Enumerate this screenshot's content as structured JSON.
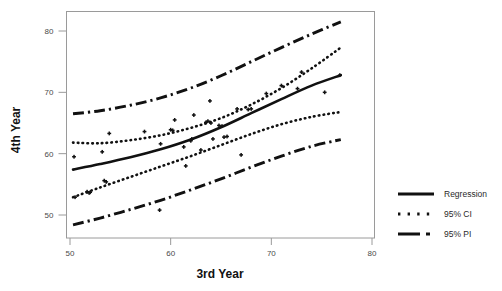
{
  "chart_data": {
    "type": "scatter",
    "title": "",
    "xlabel": "3rd Year",
    "ylabel": "4th Year",
    "xlim": [
      48.5,
      81.5
    ],
    "ylim": [
      46.5,
      83.0
    ],
    "xticks": [
      50,
      60,
      70,
      80
    ],
    "yticks": [
      50,
      60,
      70,
      80
    ],
    "xtick_labels": [
      "50",
      "60",
      "70",
      "80"
    ],
    "ytick_labels": [
      "50",
      "60",
      "70",
      "80"
    ],
    "grid": false,
    "legend_position": "right",
    "legend": [
      {
        "label": "Regression",
        "style": "solid"
      },
      {
        "label": "95% CI",
        "style": "dotted"
      },
      {
        "label": "95% PI",
        "style": "dash-dot"
      }
    ],
    "points": [
      {
        "x": 50.4,
        "y": 59.5
      },
      {
        "x": 50.5,
        "y": 52.9
      },
      {
        "x": 51.7,
        "y": 53.8
      },
      {
        "x": 51.9,
        "y": 53.6
      },
      {
        "x": 52.0,
        "y": 53.7
      },
      {
        "x": 53.2,
        "y": 60.3
      },
      {
        "x": 53.4,
        "y": 55.6
      },
      {
        "x": 53.6,
        "y": 55.4
      },
      {
        "x": 53.9,
        "y": 63.3
      },
      {
        "x": 57.4,
        "y": 63.6
      },
      {
        "x": 58.9,
        "y": 50.8
      },
      {
        "x": 59.0,
        "y": 61.6
      },
      {
        "x": 60.0,
        "y": 63.9
      },
      {
        "x": 60.2,
        "y": 63.8
      },
      {
        "x": 60.4,
        "y": 65.5
      },
      {
        "x": 61.3,
        "y": 61.1
      },
      {
        "x": 61.5,
        "y": 58.0
      },
      {
        "x": 62.0,
        "y": 62.1
      },
      {
        "x": 62.1,
        "y": 62.4
      },
      {
        "x": 62.3,
        "y": 66.3
      },
      {
        "x": 63.0,
        "y": 60.6
      },
      {
        "x": 63.5,
        "y": 65.1
      },
      {
        "x": 63.7,
        "y": 65.3
      },
      {
        "x": 63.9,
        "y": 68.6
      },
      {
        "x": 64.0,
        "y": 65.0
      },
      {
        "x": 64.2,
        "y": 62.4
      },
      {
        "x": 64.8,
        "y": 64.6
      },
      {
        "x": 65.1,
        "y": 64.5
      },
      {
        "x": 65.3,
        "y": 62.7
      },
      {
        "x": 65.6,
        "y": 62.8
      },
      {
        "x": 66.6,
        "y": 67.3
      },
      {
        "x": 67.0,
        "y": 59.8
      },
      {
        "x": 67.7,
        "y": 67.2
      },
      {
        "x": 68.0,
        "y": 67.3
      },
      {
        "x": 69.5,
        "y": 69.8
      },
      {
        "x": 71.0,
        "y": 71.1
      },
      {
        "x": 72.6,
        "y": 70.6
      },
      {
        "x": 73.0,
        "y": 73.3
      },
      {
        "x": 75.3,
        "y": 70.0
      },
      {
        "x": 76.8,
        "y": 72.8
      }
    ],
    "series": [
      {
        "name": "Regression",
        "style": "solid",
        "x": [
          50.3,
          53.0,
          56.0,
          59.0,
          62.0,
          65.0,
          68.0,
          71.0,
          74.0,
          76.9
        ],
        "y": [
          57.4,
          58.3,
          59.4,
          60.7,
          62.3,
          64.3,
          66.6,
          68.9,
          71.1,
          72.8
        ]
      },
      {
        "name": "95% CI upper",
        "style": "dotted",
        "x": [
          50.3,
          53.0,
          56.0,
          59.0,
          62.0,
          65.0,
          68.0,
          71.0,
          74.0,
          76.9
        ],
        "y": [
          61.8,
          61.7,
          62.2,
          63.0,
          64.2,
          65.8,
          68.0,
          70.7,
          73.9,
          77.3
        ]
      },
      {
        "name": "95% CI lower",
        "style": "dotted",
        "x": [
          50.3,
          53.0,
          56.0,
          59.0,
          62.0,
          65.0,
          68.0,
          71.0,
          74.0,
          76.9
        ],
        "y": [
          52.9,
          54.5,
          56.2,
          57.9,
          59.6,
          61.4,
          63.2,
          64.8,
          66.0,
          66.8
        ]
      },
      {
        "name": "95% PI upper",
        "style": "dash-dot",
        "x": [
          50.3,
          53.0,
          56.0,
          59.0,
          62.0,
          65.0,
          68.0,
          71.0,
          74.0,
          76.9
        ],
        "y": [
          66.5,
          67.0,
          67.9,
          69.1,
          70.7,
          72.7,
          75.0,
          77.3,
          79.5,
          81.5
        ]
      },
      {
        "name": "95% PI lower",
        "style": "dash-dot",
        "x": [
          50.3,
          53.0,
          56.0,
          59.0,
          62.0,
          65.0,
          68.0,
          71.0,
          74.0,
          76.9
        ],
        "y": [
          48.4,
          49.5,
          50.9,
          52.4,
          54.1,
          55.9,
          57.8,
          59.6,
          61.2,
          62.3
        ]
      }
    ]
  },
  "legend_panel": {
    "items": [
      {
        "label": "Regression"
      },
      {
        "label": "95% CI"
      },
      {
        "label": "95% PI"
      }
    ]
  },
  "axes": {
    "x_title": "3rd Year",
    "y_title": "4th Year"
  }
}
